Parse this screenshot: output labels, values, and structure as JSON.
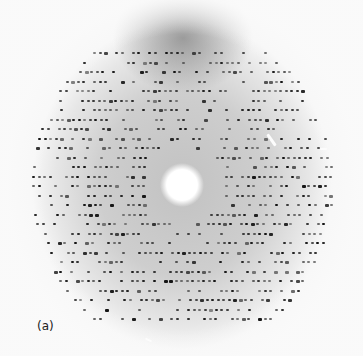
{
  "figure": {
    "panel_label": "(a)",
    "beam_center": [
      182,
      185
    ],
    "colors": {
      "background": "#f7f7f7",
      "spot": "#111111",
      "film_dark": "#5a5a5a"
    }
  }
}
